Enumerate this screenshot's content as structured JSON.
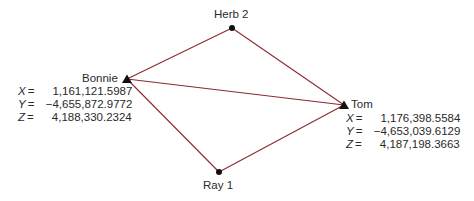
{
  "diagram": {
    "line_color": "#8b2a32",
    "stations": [
      {
        "name": "Herb 2",
        "symbol": "dot",
        "x": 232,
        "y": 28
      },
      {
        "name": "Bonnie",
        "symbol": "triangle",
        "x": 127,
        "y": 79,
        "coordinates": {
          "X": "1,161,121.5987",
          "Y": "−4,655,872.9772",
          "Z": "4,188,330.2324"
        }
      },
      {
        "name": "Tom",
        "symbol": "triangle",
        "x": 344,
        "y": 105,
        "coordinates": {
          "X": "1,176,398.5584",
          "Y": "−4,653,039.6129",
          "Z": "4,187,198.3663"
        }
      },
      {
        "name": "Ray 1",
        "symbol": "dot",
        "x": 219,
        "y": 172
      }
    ],
    "edges": [
      [
        "Herb 2",
        "Bonnie"
      ],
      [
        "Herb 2",
        "Tom"
      ],
      [
        "Bonnie",
        "Tom"
      ],
      [
        "Bonnie",
        "Ray 1"
      ],
      [
        "Tom",
        "Ray 1"
      ]
    ],
    "labels": {
      "x": "X",
      "y": "Y",
      "z": "Z",
      "eq": "="
    }
  }
}
